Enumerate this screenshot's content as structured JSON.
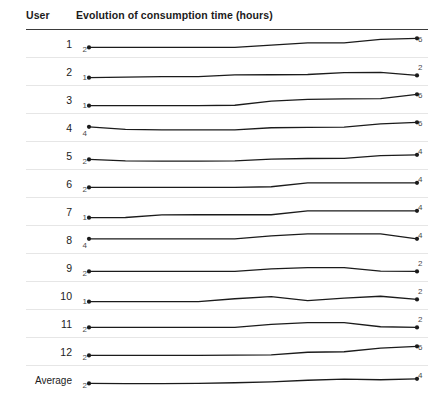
{
  "header": {
    "user_label": "User",
    "series_label": "Evolution of consumption time (hours)"
  },
  "average_label": "Average",
  "chart_data": {
    "type": "line",
    "title": "Evolution of consumption time (hours)",
    "xlabel": "",
    "ylabel": "hours",
    "grid": false,
    "legend": "none",
    "ylim": [
      0,
      7
    ],
    "x": [
      1,
      2,
      3,
      4,
      5,
      6,
      7,
      8,
      9,
      10
    ],
    "series": [
      {
        "name": "1",
        "start_value": 2,
        "end_value": 6,
        "values": [
          2,
          2,
          2,
          2,
          2,
          3,
          4,
          4,
          5.5,
          6
        ]
      },
      {
        "name": "2",
        "start_value": 1,
        "end_value": 2,
        "values": [
          1,
          1.3,
          1.5,
          1.5,
          2.2,
          2.3,
          2.4,
          3.2,
          3.3,
          2
        ]
      },
      {
        "name": "3",
        "start_value": 1,
        "end_value": 6,
        "values": [
          1,
          1,
          1,
          1,
          1.2,
          3,
          3.8,
          4,
          4.1,
          6
        ]
      },
      {
        "name": "4",
        "start_value": 4,
        "end_value": 6,
        "values": [
          4,
          2.9,
          2.7,
          2.7,
          2.7,
          3.6,
          3.8,
          3.9,
          5.3,
          6
        ]
      },
      {
        "name": "5",
        "start_value": 2,
        "end_value": 4,
        "values": [
          2,
          1.4,
          1.3,
          1.3,
          1.4,
          2.1,
          2.4,
          2.5,
          3.7,
          4
        ]
      },
      {
        "name": "6",
        "start_value": 2,
        "end_value": 4,
        "values": [
          2,
          2,
          2,
          2,
          2,
          2.3,
          4,
          4,
          4,
          4
        ]
      },
      {
        "name": "7",
        "start_value": 1,
        "end_value": 4,
        "values": [
          1,
          1.1,
          2.2,
          2.3,
          2.3,
          2.3,
          4,
          4,
          4,
          4
        ]
      },
      {
        "name": "8",
        "start_value": 4,
        "end_value": 4,
        "values": [
          4,
          4,
          4,
          4,
          4,
          5.3,
          6.2,
          6.2,
          6.2,
          4
        ]
      },
      {
        "name": "9",
        "start_value": 2,
        "end_value": 2,
        "values": [
          2,
          2,
          2,
          2,
          2,
          3.1,
          3.7,
          3.7,
          2.1,
          2
        ]
      },
      {
        "name": "10",
        "start_value": 1,
        "end_value": 2,
        "values": [
          1,
          1,
          1,
          1,
          2.3,
          3.2,
          1.5,
          2.6,
          3.4,
          2
        ]
      },
      {
        "name": "11",
        "start_value": 2,
        "end_value": 2,
        "values": [
          2,
          2,
          2,
          2,
          2,
          3.3,
          4.1,
          4.1,
          2.3,
          2
        ]
      },
      {
        "name": "12",
        "start_value": 2,
        "end_value": 6,
        "values": [
          2,
          2,
          2,
          2,
          2.1,
          2.2,
          3.4,
          3.6,
          5.2,
          6
        ]
      },
      {
        "name": "Average",
        "start_value": 2,
        "end_value": 4,
        "values": [
          2,
          1.9,
          1.9,
          2.0,
          2.3,
          2.7,
          3.4,
          3.9,
          3.6,
          4
        ]
      }
    ]
  }
}
